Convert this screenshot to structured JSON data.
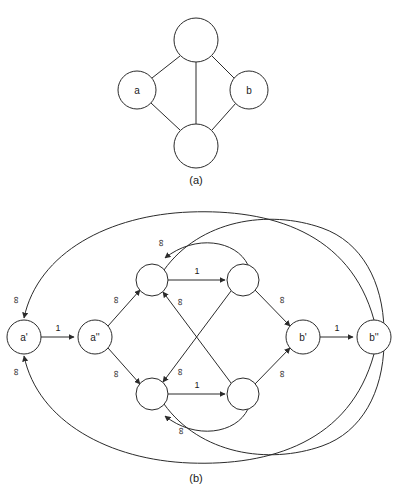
{
  "figure": {
    "caption_a": "(a)",
    "caption_b": "(b)",
    "infinity_symbol": "∞",
    "one_label": "1",
    "colors": {
      "stroke": "#2b2b2b",
      "background": "#ffffff",
      "text": "#1a1a1a"
    }
  },
  "graph_a": {
    "nodes": [
      {
        "id": "top",
        "label": "",
        "cx": 196,
        "cy": 40,
        "r": 22
      },
      {
        "id": "a",
        "label": "a",
        "cx": 137,
        "cy": 90,
        "r": 19
      },
      {
        "id": "b",
        "label": "b",
        "cx": 249,
        "cy": 90,
        "r": 19
      },
      {
        "id": "bottom",
        "label": "",
        "cx": 196,
        "cy": 146,
        "r": 22
      }
    ],
    "edges": [
      {
        "from": "top",
        "to": "a",
        "label": ""
      },
      {
        "from": "top",
        "to": "b",
        "label": ""
      },
      {
        "from": "top",
        "to": "bottom",
        "label": ""
      },
      {
        "from": "a",
        "to": "bottom",
        "label": ""
      },
      {
        "from": "b",
        "to": "bottom",
        "label": ""
      }
    ]
  },
  "graph_b": {
    "nodes": [
      {
        "id": "a1",
        "label": "a'",
        "cx": 24,
        "cy": 337,
        "r": 17
      },
      {
        "id": "a2",
        "label": "a''",
        "cx": 95,
        "cy": 337,
        "r": 17
      },
      {
        "id": "n1",
        "label": "",
        "cx": 152,
        "cy": 280,
        "r": 16
      },
      {
        "id": "n2",
        "label": "",
        "cx": 243,
        "cy": 280,
        "r": 16
      },
      {
        "id": "n3",
        "label": "",
        "cx": 152,
        "cy": 394,
        "r": 16
      },
      {
        "id": "n4",
        "label": "",
        "cx": 243,
        "cy": 394,
        "r": 16
      },
      {
        "id": "b1",
        "label": "b'",
        "cx": 303,
        "cy": 337,
        "r": 17
      },
      {
        "id": "b2",
        "label": "b''",
        "cx": 374,
        "cy": 337,
        "r": 17
      }
    ],
    "edges": [
      {
        "from": "a1",
        "to": "a2",
        "label": "1",
        "kind": "straight"
      },
      {
        "from": "b1",
        "to": "b2",
        "label": "1",
        "kind": "straight"
      },
      {
        "from": "n1",
        "to": "n2",
        "label": "1",
        "kind": "straight"
      },
      {
        "from": "n3",
        "to": "n4",
        "label": "1",
        "kind": "straight"
      },
      {
        "from": "a2",
        "to": "n1",
        "label": "∞",
        "kind": "straight"
      },
      {
        "from": "a2",
        "to": "n3",
        "label": "∞",
        "kind": "straight"
      },
      {
        "from": "n2",
        "to": "b1",
        "label": "∞",
        "kind": "straight"
      },
      {
        "from": "n4",
        "to": "b1",
        "label": "∞",
        "kind": "straight"
      },
      {
        "from": "n4",
        "to": "n1",
        "label": "∞",
        "kind": "straight"
      },
      {
        "from": "n2",
        "to": "n3",
        "label": "∞",
        "kind": "straight"
      },
      {
        "from": "n2",
        "to": "n1",
        "label": "∞",
        "kind": "arc"
      },
      {
        "from": "n4",
        "to": "n3",
        "label": "∞",
        "kind": "arc"
      },
      {
        "from": "b2",
        "to": "a1",
        "label": "∞",
        "kind": "big-arc-top"
      },
      {
        "from": "b2",
        "to": "a1",
        "label": "∞",
        "kind": "big-arc-bottom"
      },
      {
        "from": "n1",
        "to": "b2",
        "label": "",
        "kind": "big-arc-top-right"
      },
      {
        "from": "n3",
        "to": "b2",
        "label": "",
        "kind": "big-arc-bottom-right"
      }
    ]
  }
}
